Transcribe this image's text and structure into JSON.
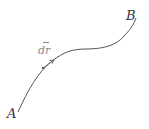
{
  "diagram": {
    "title": "",
    "type": "curve-path",
    "colors": {
      "curve": "#555555",
      "vector": "#666666",
      "label_main": "#333333",
      "label_vector": "#888888"
    },
    "points": {
      "start": {
        "label": "A",
        "x": 18,
        "y": 112
      },
      "end": {
        "label": "B",
        "x": 136,
        "y": 18
      }
    },
    "vector": {
      "label": "dr",
      "label_has_arrow": true,
      "tail": {
        "x": 43,
        "y": 68
      },
      "head": {
        "x": 54,
        "y": 60
      }
    }
  }
}
